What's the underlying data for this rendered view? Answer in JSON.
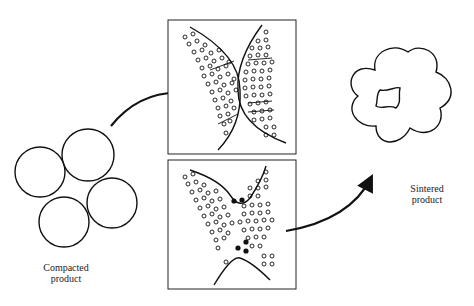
{
  "diagram": {
    "stages": [
      {
        "id": "compacted",
        "label_line1": "Compacted",
        "label_line2": "product"
      },
      {
        "id": "neck-formation",
        "label": ""
      },
      {
        "id": "pore-shrinkage",
        "label": ""
      },
      {
        "id": "sintered",
        "label_line1": "Sintered",
        "label_line2": "product"
      }
    ],
    "colors": {
      "stroke": "#111111",
      "background": "#ffffff",
      "text": "#222222"
    }
  }
}
